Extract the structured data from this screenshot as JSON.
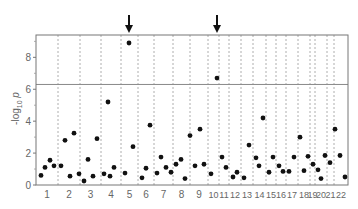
{
  "chart_data": {
    "type": "scatter",
    "subtype": "manhattan",
    "title": "",
    "xlabel": "",
    "ylabel": "-log10 p",
    "ylim": [
      0,
      9.4
    ],
    "yticks": [
      0,
      2,
      4,
      6,
      8
    ],
    "threshold": 6.3,
    "grid": false,
    "legend": null,
    "categories": [
      "1",
      "2",
      "3",
      "4",
      "5",
      "6",
      "7",
      "8",
      "9",
      "10",
      "11",
      "12",
      "13",
      "14",
      "15",
      "16",
      "17",
      "18",
      "19",
      "20",
      "21",
      "22"
    ],
    "chromosome_bounds_px": [
      36,
      58,
      80,
      101,
      121,
      138,
      154,
      173,
      190,
      208,
      219,
      229,
      241,
      253,
      266,
      276,
      286,
      298,
      310,
      315,
      327,
      334,
      348
    ],
    "annotations": [
      {
        "type": "arrow",
        "chromosome": "5",
        "x_px": 129
      },
      {
        "type": "arrow",
        "chromosome": "10",
        "x_px": 217
      }
    ],
    "points": [
      {
        "chr": "1",
        "x_px": 41,
        "y": 0.6
      },
      {
        "chr": "1",
        "x_px": 45,
        "y": 1.1
      },
      {
        "chr": "1",
        "x_px": 50,
        "y": 1.55
      },
      {
        "chr": "1",
        "x_px": 54,
        "y": 1.2
      },
      {
        "chr": "2",
        "x_px": 61,
        "y": 1.2
      },
      {
        "chr": "2",
        "x_px": 65,
        "y": 2.8
      },
      {
        "chr": "2",
        "x_px": 70,
        "y": 0.55
      },
      {
        "chr": "2",
        "x_px": 74,
        "y": 3.25
      },
      {
        "chr": "3",
        "x_px": 79,
        "y": 0.7
      },
      {
        "chr": "3",
        "x_px": 84,
        "y": 0.25
      },
      {
        "chr": "3",
        "x_px": 88,
        "y": 1.6
      },
      {
        "chr": "3",
        "x_px": 93,
        "y": 0.55
      },
      {
        "chr": "3",
        "x_px": 97,
        "y": 2.9
      },
      {
        "chr": "4",
        "x_px": 104,
        "y": 0.7
      },
      {
        "chr": "4",
        "x_px": 108,
        "y": 5.2
      },
      {
        "chr": "4",
        "x_px": 110,
        "y": 0.55
      },
      {
        "chr": "4",
        "x_px": 114,
        "y": 1.1
      },
      {
        "chr": "5",
        "x_px": 125,
        "y": 0.75
      },
      {
        "chr": "5",
        "x_px": 129,
        "y": 8.9
      },
      {
        "chr": "5",
        "x_px": 133,
        "y": 2.4
      },
      {
        "chr": "6",
        "x_px": 142,
        "y": 0.45
      },
      {
        "chr": "6",
        "x_px": 146,
        "y": 1.05
      },
      {
        "chr": "6",
        "x_px": 150,
        "y": 3.75
      },
      {
        "chr": "7",
        "x_px": 157,
        "y": 0.75
      },
      {
        "chr": "7",
        "x_px": 161,
        "y": 1.75
      },
      {
        "chr": "7",
        "x_px": 166,
        "y": 1.1
      },
      {
        "chr": "7",
        "x_px": 171,
        "y": 0.8
      },
      {
        "chr": "8",
        "x_px": 176,
        "y": 1.3
      },
      {
        "chr": "8",
        "x_px": 181,
        "y": 1.6
      },
      {
        "chr": "8",
        "x_px": 185,
        "y": 0.4
      },
      {
        "chr": "9",
        "x_px": 190,
        "y": 3.1
      },
      {
        "chr": "9",
        "x_px": 195,
        "y": 1.2
      },
      {
        "chr": "9",
        "x_px": 200,
        "y": 3.5
      },
      {
        "chr": "9",
        "x_px": 204,
        "y": 1.3
      },
      {
        "chr": "10",
        "x_px": 211,
        "y": 0.7
      },
      {
        "chr": "10",
        "x_px": 217,
        "y": 6.7
      },
      {
        "chr": "11",
        "x_px": 222,
        "y": 1.75
      },
      {
        "chr": "11",
        "x_px": 226,
        "y": 1.1
      },
      {
        "chr": "12",
        "x_px": 233,
        "y": 0.5
      },
      {
        "chr": "12",
        "x_px": 237,
        "y": 0.8
      },
      {
        "chr": "13",
        "x_px": 244,
        "y": 0.45
      },
      {
        "chr": "13",
        "x_px": 249,
        "y": 2.5
      },
      {
        "chr": "14",
        "x_px": 256,
        "y": 1.7
      },
      {
        "chr": "14",
        "x_px": 259,
        "y": 1.2
      },
      {
        "chr": "14",
        "x_px": 263,
        "y": 4.2
      },
      {
        "chr": "15",
        "x_px": 269,
        "y": 0.8
      },
      {
        "chr": "15",
        "x_px": 273,
        "y": 1.75
      },
      {
        "chr": "16",
        "x_px": 279,
        "y": 1.2
      },
      {
        "chr": "16",
        "x_px": 283,
        "y": 0.85
      },
      {
        "chr": "17",
        "x_px": 289,
        "y": 0.85
      },
      {
        "chr": "17",
        "x_px": 294,
        "y": 1.75
      },
      {
        "chr": "18",
        "x_px": 300,
        "y": 3.0
      },
      {
        "chr": "18",
        "x_px": 304,
        "y": 0.9
      },
      {
        "chr": "19",
        "x_px": 308,
        "y": 1.8
      },
      {
        "chr": "19",
        "x_px": 313,
        "y": 1.3
      },
      {
        "chr": "20",
        "x_px": 318,
        "y": 0.95
      },
      {
        "chr": "20",
        "x_px": 321,
        "y": 0.4
      },
      {
        "chr": "20",
        "x_px": 325,
        "y": 1.85
      },
      {
        "chr": "21",
        "x_px": 330,
        "y": 1.4
      },
      {
        "chr": "21",
        "x_px": 335,
        "y": 3.5
      },
      {
        "chr": "22",
        "x_px": 340,
        "y": 1.85
      },
      {
        "chr": "22",
        "x_px": 345,
        "y": 0.5
      }
    ]
  },
  "labels": {
    "ylabel_main": "-log",
    "ylabel_sub": "10",
    "ylabel_tail": " p"
  }
}
